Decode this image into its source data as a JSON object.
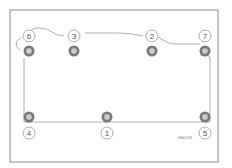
{
  "diagram": {
    "frame": {
      "x": 10,
      "y": 10,
      "width": 208,
      "height": 152,
      "stroke": "#8a8a8a"
    },
    "outline_color": "#9a9a9a",
    "bolt_color_outer": "#7a7a7a",
    "bolt_color_inner": "#b5b5b5",
    "callout_stroke": "#9a9a9a",
    "bolts": [
      {
        "label": "1",
        "x": 107,
        "y": 117,
        "callout_x": 107,
        "callout_y": 133
      },
      {
        "label": "2",
        "x": 152,
        "y": 51,
        "callout_x": 152,
        "callout_y": 36
      },
      {
        "label": "3",
        "x": 74,
        "y": 51,
        "callout_x": 74,
        "callout_y": 36
      },
      {
        "label": "4",
        "x": 29,
        "y": 117,
        "callout_x": 29,
        "callout_y": 133
      },
      {
        "label": "5",
        "x": 205,
        "y": 117,
        "callout_x": 205,
        "callout_y": 133
      },
      {
        "label": "6",
        "x": 29,
        "y": 51,
        "callout_x": 29,
        "callout_y": 36
      },
      {
        "label": "7",
        "x": 205,
        "y": 51,
        "callout_x": 205,
        "callout_y": 36
      }
    ],
    "reference_code": "H40149",
    "reference_position": {
      "x": 185,
      "y": 138
    }
  }
}
